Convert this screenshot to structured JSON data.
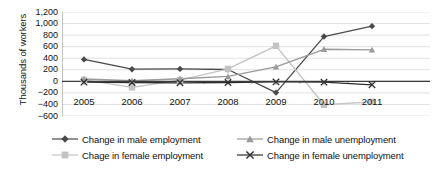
{
  "chart_data": {
    "type": "line",
    "title": "",
    "subtitle": "",
    "xlabel": "",
    "ylabel": "Thousands of workers",
    "categories": [
      "2005",
      "2006",
      "2007",
      "2008",
      "2009",
      "2010",
      "2011"
    ],
    "ylim": [
      -600,
      1200
    ],
    "ytick_step": 200,
    "yticks": [
      "1,200",
      "1,000",
      "800",
      "600",
      "400",
      "200",
      "0",
      "−200",
      "−400",
      "−600"
    ],
    "ytick_values": [
      1200,
      1000,
      800,
      600,
      400,
      200,
      0,
      -200,
      -400,
      -600
    ],
    "grid": true,
    "grid_axis": "y",
    "legend_position": "bottom",
    "zero_line": true,
    "series": [
      {
        "name": "Change in male employment",
        "marker": "diamond",
        "color": "#4a4a4a",
        "values": [
          380,
          210,
          215,
          205,
          -195,
          775,
          955
        ]
      },
      {
        "name": "Chage in female employment",
        "marker": "square",
        "color": "#c3c3c3",
        "values": [
          25,
          -105,
          20,
          215,
          615,
          -405,
          -355
        ]
      },
      {
        "name": "Change in male unemployment",
        "marker": "triangle",
        "color": "#9a9a9a",
        "values": [
          40,
          10,
          45,
          85,
          250,
          555,
          545
        ]
      },
      {
        "name": "Change in female unemployment",
        "marker": "x",
        "color": "#2e2e2e",
        "values": [
          -15,
          -20,
          -25,
          -20,
          -10,
          -15,
          -60
        ]
      }
    ]
  },
  "legend": {
    "items": [
      {
        "label": "Change in male employment"
      },
      {
        "label": "Chage in female employment"
      },
      {
        "label": "Change in male unemployment"
      },
      {
        "label": "Change in female unemployment"
      }
    ]
  },
  "colors": {
    "male_employment": "#4a4a4a",
    "female_employment": "#c3c3c3",
    "male_unemployment": "#9a9a9a",
    "female_unemployment": "#2e2e2e",
    "gridline": "#d9d9d9",
    "axis": "#808080",
    "zero_line": "#3a3a3a",
    "background": "#ffffff",
    "text": "#111111"
  }
}
